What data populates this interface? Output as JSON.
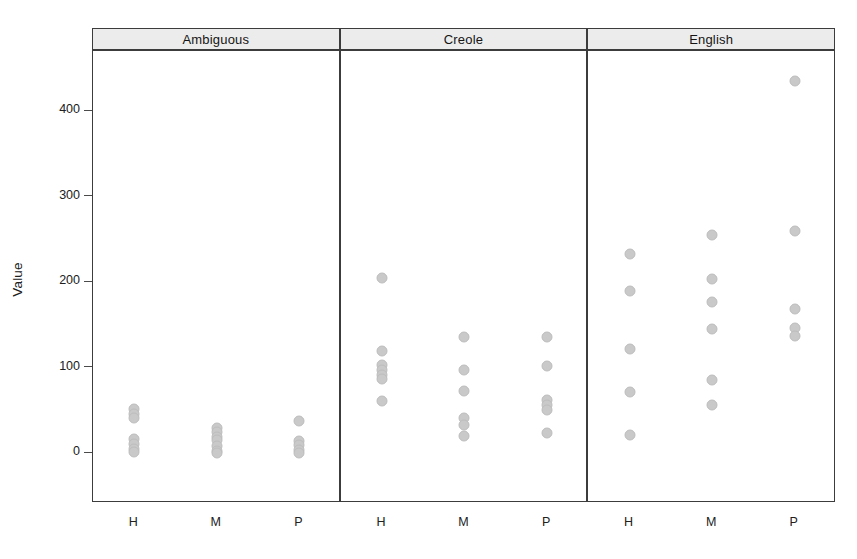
{
  "chart_data": {
    "type": "scatter",
    "title": "",
    "subtitle": "",
    "xlabel": "",
    "ylabel": "Value",
    "ylim": [
      -30,
      460
    ],
    "yticks": [
      0,
      100,
      200,
      300,
      400
    ],
    "ytick_labels": [
      "0",
      "100",
      "200",
      "300",
      "400"
    ],
    "xcategories": [
      "H",
      "M",
      "P"
    ],
    "grid": false,
    "legend": false,
    "layout": "trellis-3-panels-horizontal",
    "marker": {
      "shape": "circle",
      "fill": "#c9c9c9",
      "edge": "#bdbdbd",
      "size": 11
    },
    "panels": [
      {
        "label": "Ambiguous",
        "groups": [
          {
            "x": "H",
            "values": [
              52,
              46,
              41,
              16,
              10,
              5,
              1
            ]
          },
          {
            "x": "M",
            "values": [
              29,
              24,
              19,
              15,
              8,
              2,
              0
            ]
          },
          {
            "x": "P",
            "values": [
              38,
              14,
              9,
              3,
              0
            ]
          }
        ]
      },
      {
        "label": "Creole",
        "groups": [
          {
            "x": "H",
            "values": [
              205,
              119,
              103,
              97,
              91,
              86,
              61
            ]
          },
          {
            "x": "M",
            "values": [
              136,
              97,
              73,
              41,
              33,
              20
            ]
          },
          {
            "x": "P",
            "values": [
              136,
              102,
              62,
              56,
              50,
              23
            ]
          }
        ]
      },
      {
        "label": "English",
        "groups": [
          {
            "x": "H",
            "values": [
              233,
              190,
              122,
              71,
              21
            ]
          },
          {
            "x": "M",
            "values": [
              255,
              203,
              177,
              145,
              85,
              56
            ]
          },
          {
            "x": "P",
            "values": [
              435,
              260,
              168,
              146,
              137
            ]
          }
        ]
      }
    ]
  },
  "axes": {
    "y_title": "Value"
  }
}
